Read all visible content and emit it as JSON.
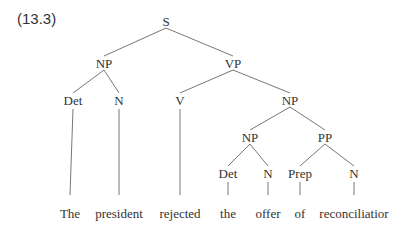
{
  "example_number": "(13.3)",
  "colors": {
    "text": "#333333",
    "line": "#666666",
    "background": "#ffffff"
  },
  "nodes": [
    {
      "id": "S",
      "label": "S",
      "x": 166,
      "y": 21
    },
    {
      "id": "NP1",
      "label": "NP",
      "x": 104,
      "y": 63
    },
    {
      "id": "VP",
      "label": "VP",
      "x": 233,
      "y": 63
    },
    {
      "id": "Det1",
      "label": "Det",
      "x": 73,
      "y": 100
    },
    {
      "id": "N1",
      "label": "N",
      "x": 119,
      "y": 100
    },
    {
      "id": "V",
      "label": "V",
      "x": 180,
      "y": 100
    },
    {
      "id": "NP2",
      "label": "NP",
      "x": 290,
      "y": 100
    },
    {
      "id": "NP3",
      "label": "NP",
      "x": 250,
      "y": 137
    },
    {
      "id": "PP",
      "label": "PP",
      "x": 325,
      "y": 137
    },
    {
      "id": "Det2",
      "label": "Det",
      "x": 228,
      "y": 173
    },
    {
      "id": "N2",
      "label": "N",
      "x": 268,
      "y": 173
    },
    {
      "id": "Prep",
      "label": "Prep",
      "x": 300,
      "y": 173
    },
    {
      "id": "N3",
      "label": "N",
      "x": 354,
      "y": 173
    }
  ],
  "leaves": [
    {
      "label": "The",
      "x": 70,
      "y": 213,
      "parent": "Det1"
    },
    {
      "label": "president",
      "x": 119,
      "y": 213,
      "parent": "N1"
    },
    {
      "label": "rejected",
      "x": 180,
      "y": 213,
      "parent": "V"
    },
    {
      "label": "the",
      "x": 228,
      "y": 213,
      "parent": "Det2"
    },
    {
      "label": "offer",
      "x": 268,
      "y": 213,
      "parent": "N2"
    },
    {
      "label": "of",
      "x": 300,
      "y": 213,
      "parent": "Prep"
    },
    {
      "label": "reconciliatior",
      "x": 354,
      "y": 213,
      "parent": "N3"
    }
  ],
  "edges": [
    {
      "from": "S",
      "to": "NP1"
    },
    {
      "from": "S",
      "to": "VP"
    },
    {
      "from": "NP1",
      "to": "Det1"
    },
    {
      "from": "NP1",
      "to": "N1"
    },
    {
      "from": "VP",
      "to": "V"
    },
    {
      "from": "VP",
      "to": "NP2"
    },
    {
      "from": "NP2",
      "to": "NP3"
    },
    {
      "from": "NP2",
      "to": "PP"
    },
    {
      "from": "NP3",
      "to": "Det2"
    },
    {
      "from": "NP3",
      "to": "N2"
    },
    {
      "from": "PP",
      "to": "Prep"
    },
    {
      "from": "PP",
      "to": "N3"
    }
  ]
}
